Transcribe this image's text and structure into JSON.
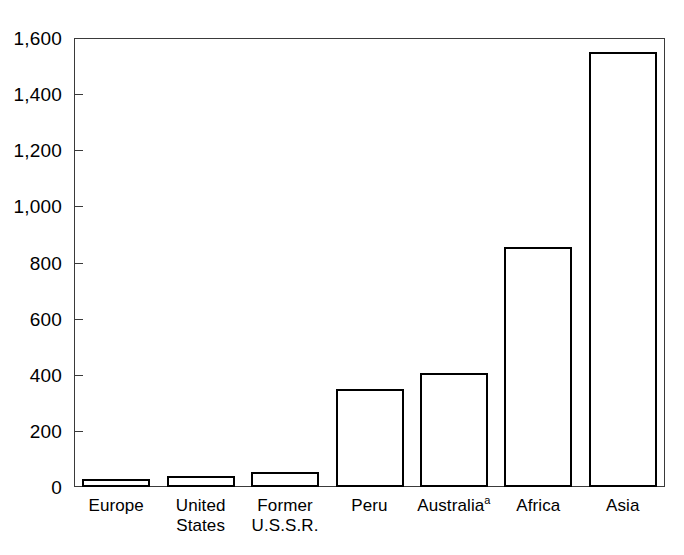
{
  "title_remnant": "· · · · · · · · · · · · · · ·",
  "chart_data": {
    "type": "bar",
    "title": "",
    "subtitle": "",
    "xlabel": "",
    "ylabel": "",
    "categories": [
      "Europe",
      "United\nStates",
      "Former\nU.S.S.R.",
      "Peru",
      "Australia",
      "Africa",
      "Asia"
    ],
    "category_footnotes": [
      "",
      "",
      "",
      "",
      "a",
      "",
      ""
    ],
    "values": [
      28,
      40,
      55,
      350,
      405,
      855,
      1550
    ],
    "ylim": [
      0,
      1600
    ],
    "ytick_values": [
      0,
      200,
      400,
      600,
      800,
      1000,
      1200,
      1400,
      1600
    ],
    "ytick_labels": [
      "0",
      "200",
      "400",
      "600",
      "800",
      "1,000",
      "1,200",
      "1,400",
      "1,600"
    ],
    "grid": false,
    "legend": null,
    "bar_fill": "#ffffff",
    "bar_edge": "#000000",
    "axis_color": "#3a3a3a"
  }
}
